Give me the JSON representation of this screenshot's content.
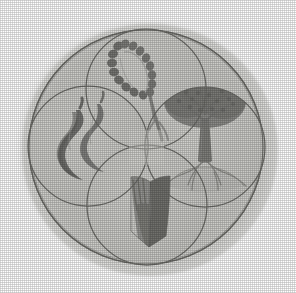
{
  "image": {
    "kind": "emblem-illustration",
    "title": "Four-circle emblem",
    "description": "Grayscale halftone print of a large circle enclosing four overlapping circles, each containing a pictorial symbol",
    "background_color": "#ffffff",
    "canvas": {
      "width": 296,
      "height": 293
    }
  },
  "palette": {
    "paper": "#ffffff",
    "blob_fill": "#cfcfcb",
    "blob_edge": "#dcdcd8",
    "disc_fill": "#c9c9c5",
    "disc_fill_light": "#d2d2ce",
    "outline": "#6e6e6a",
    "outline_soft": "#8a8a86",
    "symbol_dark": "#6b6b67",
    "symbol_mid": "#828280",
    "symbol_light": "#9a9a97"
  },
  "emblem": {
    "outer_ring": {
      "label": "outer circle border",
      "center": {
        "cx": 146,
        "cy": 147
      },
      "radius": 117,
      "stroke": "#6e6e6a",
      "stroke_width": 1.4
    },
    "backdrop_blob": {
      "label": "soft printed background blob",
      "center": {
        "cx": 147,
        "cy": 147
      },
      "radius": 131,
      "fill": "#cfcfcb"
    },
    "quadrant_radius": 60,
    "quadrants": [
      {
        "id": "top",
        "position_label": "top circle",
        "symbol_name": "wheat-ear-icon",
        "symbol_label": "Ear of wheat / grain stalk",
        "center": {
          "cx": 146,
          "cy": 89
        },
        "fill": "#cdcdc9"
      },
      {
        "id": "left",
        "position_label": "left circle",
        "symbol_name": "flame-smoke-icon",
        "symbol_label": "Twin flame / smoke curls",
        "center": {
          "cx": 88,
          "cy": 146
        },
        "fill": "#cdcdc9"
      },
      {
        "id": "right",
        "position_label": "right circle",
        "symbol_name": "tree-icon",
        "symbol_label": "Broad-canopy tree with roots",
        "center": {
          "cx": 205,
          "cy": 147
        },
        "fill": "#cdcdc9"
      },
      {
        "id": "bottom",
        "position_label": "bottom circle",
        "symbol_name": "open-book-icon",
        "symbol_label": "Open book",
        "center": {
          "cx": 147,
          "cy": 205
        },
        "fill": "#cdcdc9"
      }
    ],
    "center_node": {
      "label": "central overlap region",
      "cx": 146,
      "cy": 147
    }
  },
  "accessibility": {
    "alt_text": "Circular emblem divided into four overlapping circles containing a wheat ear, flame curls, a tree, and an open book."
  }
}
